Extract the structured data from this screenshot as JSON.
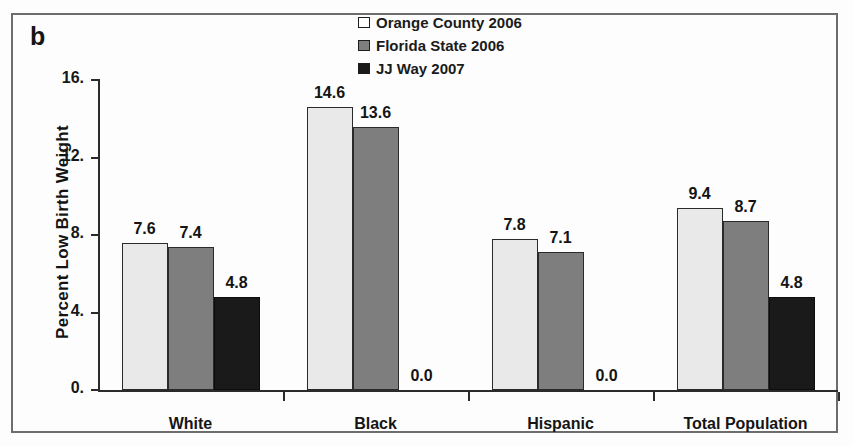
{
  "panel": {
    "label": "b"
  },
  "legend": {
    "position": "top-center",
    "entries": [
      {
        "label": "Orange County 2006",
        "swatch": "legend-swatch-white",
        "color": "#ffffff"
      },
      {
        "label": "Florida State 2006",
        "swatch": "legend-swatch-gray",
        "color": "#7e7e7e"
      },
      {
        "label": "JJ Way 2007",
        "swatch": "legend-swatch-black",
        "color": "#1a1a1a"
      }
    ]
  },
  "axes": {
    "ylabel": "Percent Low Birth Weight",
    "yticks": [
      "16.",
      "12.",
      "8.",
      "4.",
      "0."
    ],
    "ytick_values": [
      16,
      12,
      8,
      4,
      0
    ],
    "xlabel": ""
  },
  "chart_data": {
    "type": "bar",
    "title": "",
    "subtitle": "",
    "xlabel": "",
    "ylabel": "Percent Low Birth Weight",
    "ylim": [
      0,
      16
    ],
    "ytick_labels": [
      "0.",
      "4.",
      "8.",
      "12.",
      "16."
    ],
    "grid": false,
    "legend_position": "top-center",
    "categories": [
      "White",
      "Black",
      "Hispanic",
      "Total Population"
    ],
    "series": [
      {
        "name": "Orange County 2006",
        "color": "#e9e9e9",
        "values": [
          7.6,
          14.6,
          7.8,
          9.4
        ],
        "labels": [
          "7.6",
          "14.6",
          "7.8",
          "9.4"
        ]
      },
      {
        "name": "Florida State 2006",
        "color": "#7e7e7e",
        "values": [
          7.4,
          13.6,
          7.1,
          8.7
        ],
        "labels": [
          "7.4",
          "13.6",
          "7.1",
          "8.7"
        ]
      },
      {
        "name": "JJ Way 2007",
        "color": "#1a1a1a",
        "values": [
          4.8,
          0.0,
          0.0,
          4.8
        ],
        "labels": [
          "4.8",
          "0.0",
          "0.0",
          "4.8"
        ]
      }
    ]
  }
}
